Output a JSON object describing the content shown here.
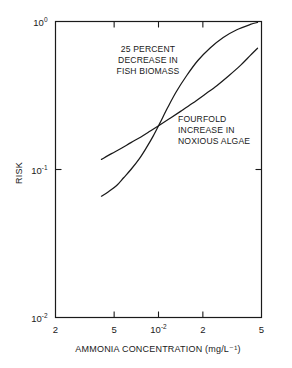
{
  "chart_data": {
    "type": "line",
    "title": "",
    "subtitle": "",
    "xlabel": "AMMONIA CONCENTRATION (mg/L⁻¹)",
    "ylabel": "RISK",
    "xscale": "log",
    "yscale": "log",
    "xlim": [
      0.002,
      0.05
    ],
    "ylim": [
      0.01,
      1.0
    ],
    "grid": false,
    "legend": false,
    "legend_position": "none",
    "xticks": [
      {
        "value": 0.002,
        "label": "2",
        "sup": ""
      },
      {
        "value": 0.005,
        "label": "5",
        "sup": ""
      },
      {
        "value": 0.01,
        "label": "10",
        "sup": "-2"
      },
      {
        "value": 0.02,
        "label": "2",
        "sup": ""
      },
      {
        "value": 0.05,
        "label": "5",
        "sup": ""
      }
    ],
    "yticks": [
      {
        "value": 1.0,
        "label": "10",
        "sup": "0"
      },
      {
        "value": 0.1,
        "label": "10",
        "sup": "-1"
      },
      {
        "value": 0.01,
        "label": "10",
        "sup": "-2"
      }
    ],
    "series": [
      {
        "name": "25 PERCENT DECREASE IN FISH BIOMASS",
        "annotation": "25 PERCENT\nDECREASE IN\nFISH BIOMASS",
        "color": "#1a1a1a",
        "x": [
          0.0041,
          0.0046,
          0.0052,
          0.0058,
          0.0065,
          0.0074,
          0.0083,
          0.0092,
          0.0102,
          0.0115,
          0.0132,
          0.0155,
          0.0185,
          0.0225,
          0.0275,
          0.034,
          0.042,
          0.047
        ],
        "y": [
          0.066,
          0.071,
          0.078,
          0.088,
          0.1,
          0.118,
          0.141,
          0.168,
          0.205,
          0.26,
          0.335,
          0.43,
          0.545,
          0.665,
          0.78,
          0.88,
          0.955,
          0.985
        ]
      },
      {
        "name": "FOURFOLD INCREASE IN NOXIOUS ALGAE",
        "annotation": "FOURFOLD\nINCREASE IN\nNOXIOUS ALGAE",
        "color": "#1a1a1a",
        "x": [
          0.0041,
          0.0048,
          0.0056,
          0.0065,
          0.0076,
          0.0088,
          0.0102,
          0.012,
          0.0142,
          0.017,
          0.0205,
          0.025,
          0.03,
          0.036,
          0.042,
          0.047
        ],
        "y": [
          0.117,
          0.128,
          0.139,
          0.152,
          0.166,
          0.182,
          0.2,
          0.222,
          0.248,
          0.28,
          0.32,
          0.37,
          0.43,
          0.505,
          0.59,
          0.66
        ]
      }
    ],
    "annotations": [
      {
        "id": "fish-biomass-annotation",
        "lines": [
          "25 PERCENT",
          "DECREASE IN",
          "FISH BIOMASS"
        ],
        "anchor": "middle",
        "x": 148,
        "y": 52
      },
      {
        "id": "noxious-algae-annotation",
        "lines": [
          "FOURFOLD",
          "INCREASE IN",
          "NOXIOUS ALGAE"
        ],
        "anchor": "start",
        "x": 178,
        "y": 122
      }
    ]
  },
  "figure": {
    "background_color": "#ffffff",
    "axis_color": "#1a1a1a",
    "curve_color": "#1a1a1a"
  }
}
